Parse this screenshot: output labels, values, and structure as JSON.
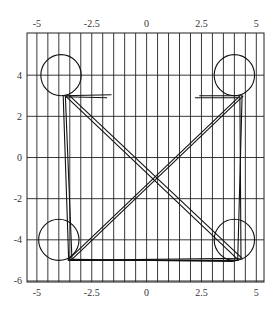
{
  "chart_data": {
    "type": "line",
    "title": "",
    "xlabel": "",
    "ylabel": "",
    "xlim": [
      -5.45,
      5.35
    ],
    "ylim": [
      -6.05,
      6.05
    ],
    "grid": {
      "vertical_step": 0.5,
      "horizontal_step": 2,
      "on": true
    },
    "x_ticks": [
      -5,
      -2.5,
      0,
      2.5,
      5
    ],
    "x_tick_labels": [
      "-5",
      "-2.5",
      "0",
      "2.5",
      "5"
    ],
    "y_ticks": [
      4,
      2,
      0,
      -2,
      -4,
      -6
    ],
    "y_tick_labels": [
      "4",
      "2",
      "0",
      "-2",
      "-4",
      "-6"
    ],
    "x_axis_labels_top": true,
    "x_axis_labels_bottom": true,
    "circles": [
      {
        "name": "top-left-circle",
        "cx": -3.9,
        "cy": 4,
        "rx": 0.92,
        "ry": 1.0
      },
      {
        "name": "top-right-circle",
        "cx": 4.0,
        "cy": 4,
        "rx": 0.92,
        "ry": 1.0
      },
      {
        "name": "bottom-left-circle",
        "cx": -4.0,
        "cy": -4,
        "rx": 0.92,
        "ry": 1.0
      },
      {
        "name": "bottom-right-circle",
        "cx": 4.0,
        "cy": -4,
        "rx": 0.92,
        "ry": 1.0
      }
    ],
    "series": [
      {
        "name": "path-a",
        "x": [
          -1.6,
          -3.8,
          -3.55,
          4.15,
          4.35,
          2.4
        ],
        "y": [
          3.05,
          3.0,
          -5.0,
          -5.0,
          3.0,
          3.0
        ]
      },
      {
        "name": "path-b",
        "x": [
          -1.8,
          -3.7,
          -3.4,
          4.3,
          4.25,
          2.2
        ],
        "y": [
          2.9,
          2.95,
          -5.0,
          -4.9,
          2.9,
          2.9
        ]
      },
      {
        "name": "diagonal-tl-br",
        "x": [
          -3.7,
          4.2
        ],
        "y": [
          3.0,
          -5.0
        ]
      },
      {
        "name": "diagonal-tl-br-2",
        "x": [
          -3.5,
          4.35
        ],
        "y": [
          3.0,
          -4.9
        ]
      },
      {
        "name": "diagonal-bl-tr",
        "x": [
          -3.6,
          4.25
        ],
        "y": [
          -5.0,
          3.0
        ]
      },
      {
        "name": "diagonal-bl-tr-2",
        "x": [
          -3.4,
          4.4
        ],
        "y": [
          -4.95,
          3.0
        ]
      },
      {
        "name": "bottom-edge",
        "x": [
          -3.5,
          3.9,
          4.1
        ],
        "y": [
          -4.95,
          -5.05,
          -5.0
        ]
      }
    ]
  }
}
